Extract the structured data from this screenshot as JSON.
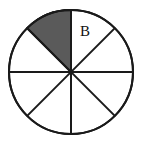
{
  "figure": {
    "background_color": "#ffffff",
    "stroke_color": "#1a1a1a",
    "stroke_width": 2,
    "shaded_fill_color": "#5a5a5a",
    "unshaded_fill_color": "#ffffff",
    "circle": {
      "center_x": 71,
      "center_y": 72,
      "radius": 62,
      "sector_count": 8,
      "sector_angle_degrees": 45
    },
    "labels": [
      {
        "text": "B",
        "x": 80,
        "y": 24,
        "sector_index": 0,
        "description": "label for sector between 45 and 90 degrees"
      }
    ],
    "sectors": [
      {
        "index": 0,
        "start_angle": 45,
        "end_angle": 90,
        "shaded": false,
        "label": "B"
      },
      {
        "index": 1,
        "start_angle": 90,
        "end_angle": 135,
        "shaded": true,
        "label": ""
      },
      {
        "index": 2,
        "start_angle": 135,
        "end_angle": 180,
        "shaded": false,
        "label": ""
      },
      {
        "index": 3,
        "start_angle": 180,
        "end_angle": 225,
        "shaded": false,
        "label": ""
      },
      {
        "index": 4,
        "start_angle": 225,
        "end_angle": 270,
        "shaded": false,
        "label": ""
      },
      {
        "index": 5,
        "start_angle": 270,
        "end_angle": 315,
        "shaded": false,
        "label": ""
      },
      {
        "index": 6,
        "start_angle": 315,
        "end_angle": 360,
        "shaded": false,
        "label": ""
      },
      {
        "index": 7,
        "start_angle": 0,
        "end_angle": 45,
        "shaded": false,
        "label": ""
      }
    ],
    "diameters": [
      {
        "name": "vertical-diameter",
        "angle_degrees": 90
      },
      {
        "name": "horizontal-diameter",
        "angle_degrees": 0
      },
      {
        "name": "diagonal-diameter-45",
        "angle_degrees": 45
      },
      {
        "name": "diagonal-diameter-135",
        "angle_degrees": 135
      }
    ]
  }
}
